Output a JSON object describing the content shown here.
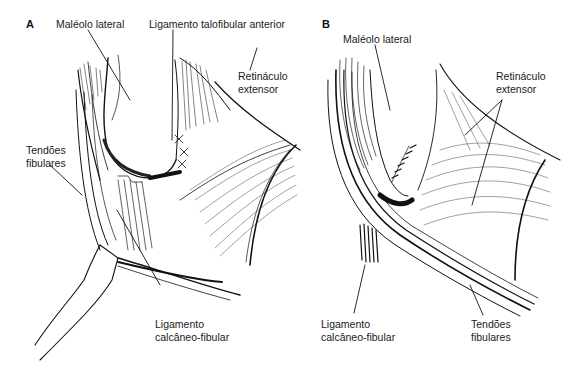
{
  "figure": {
    "panels": [
      {
        "id": "A",
        "letter": "A",
        "labels": {
          "malleolus": "Maléolo lateral",
          "atfl": "Ligamento talofibular anterior",
          "retinaculum_1": "Retináculo",
          "retinaculum_2": "extensor",
          "tendons_1": "Tendões",
          "tendons_2": "fibulares",
          "cfl_1": "Ligamento",
          "cfl_2": "calcâneo-fibular"
        }
      },
      {
        "id": "B",
        "letter": "B",
        "labels": {
          "malleolus": "Maléolo lateral",
          "retinaculum_1": "Retináculo",
          "retinaculum_2": "extensor",
          "cfl_1": "Ligamento",
          "cfl_2": "calcâneo-fibular",
          "tendons_1": "Tendões",
          "tendons_2": "fibulares"
        }
      }
    ],
    "colors": {
      "ink": "#111111",
      "background": "#ffffff",
      "shade": "#555555"
    }
  }
}
